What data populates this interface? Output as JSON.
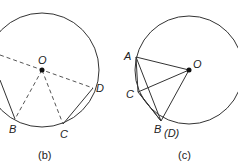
{
  "panels": [
    {
      "id": "b",
      "caption": "(b)",
      "points": {
        "O": "O",
        "B": "B",
        "C": "C",
        "D": "D"
      }
    },
    {
      "id": "c",
      "caption": "(c)",
      "points": {
        "A": "A",
        "O": "O",
        "C": "C",
        "B": "B",
        "D": "(D)"
      }
    }
  ],
  "colors": {
    "stroke": "#333333",
    "dashed": "#555555",
    "text": "#222222"
  }
}
